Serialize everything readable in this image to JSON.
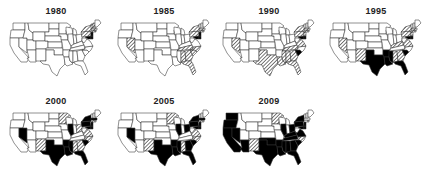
{
  "figure": {
    "type": "small-multiple-choropleth",
    "region": "United States (contiguous 48)",
    "legend": [
      {
        "key": "none",
        "fill": "#ffffff",
        "label": ""
      },
      {
        "key": "hatched",
        "fill": "hatch",
        "label": ""
      },
      {
        "key": "solid",
        "fill": "#000000",
        "label": ""
      }
    ]
  },
  "panels": [
    {
      "title": "1980",
      "hatched": [
        "NY",
        "PA",
        "MA",
        "CT",
        "NJ",
        "VT",
        "NH",
        "RI"
      ],
      "solid": [
        "NJ",
        "DE",
        "MD"
      ]
    },
    {
      "title": "1985",
      "hatched": [
        "NV",
        "NY",
        "PA",
        "TN",
        "NC",
        "SC",
        "GA",
        "AL",
        "FL",
        "CT",
        "MA"
      ],
      "solid": [
        "NJ",
        "DE",
        "MD"
      ]
    },
    {
      "title": "1990",
      "hatched": [
        "NV",
        "TX",
        "LA",
        "MS",
        "AL",
        "GA",
        "FL",
        "TN",
        "NY",
        "PA",
        "CT",
        "MA",
        "NJ",
        "VA"
      ],
      "solid": [
        "SC",
        "MD",
        "DE"
      ]
    },
    {
      "title": "1995",
      "hatched": [
        "NV",
        "NM",
        "AL",
        "GA",
        "NY",
        "PA",
        "MA",
        "CT",
        "NJ",
        "KY",
        "VA"
      ],
      "solid": [
        "TX",
        "LA",
        "MS",
        "SC",
        "FL",
        "AR",
        "MD",
        "DE"
      ]
    },
    {
      "title": "2000",
      "hatched": [
        "MN",
        "NM",
        "AL",
        "GA",
        "OH",
        "VA",
        "NC",
        "CT"
      ],
      "solid": [
        "NV",
        "TX",
        "LA",
        "MS",
        "SC",
        "FL",
        "AR",
        "IL",
        "NY",
        "PA",
        "NJ",
        "MD",
        "DE",
        "MA"
      ]
    },
    {
      "title": "2005",
      "hatched": [
        "MN",
        "NM",
        "AL",
        "VA",
        "NC",
        "CT"
      ],
      "solid": [
        "NV",
        "TX",
        "LA",
        "MS",
        "SC",
        "FL",
        "AR",
        "GA",
        "IL",
        "NY",
        "PA",
        "NJ",
        "MD",
        "DE",
        "MA",
        "OH"
      ]
    },
    {
      "title": "2009",
      "hatched": [
        "MN",
        "NM",
        "NC"
      ],
      "solid": [
        "WA",
        "OR",
        "CA",
        "NV",
        "AZ",
        "TX",
        "LA",
        "MS",
        "AL",
        "GA",
        "SC",
        "FL",
        "AR",
        "IL",
        "KY",
        "TN",
        "NY",
        "PA",
        "NJ",
        "MD",
        "DE",
        "OH",
        "VA",
        "OK"
      ]
    }
  ]
}
